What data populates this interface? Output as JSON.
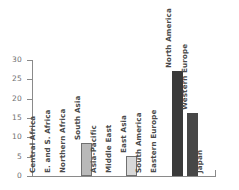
{
  "chart_data": {
    "type": "bar",
    "title": "",
    "xlabel": "",
    "ylabel": "",
    "ylim": [
      0,
      30
    ],
    "yticks": [
      0,
      5,
      10,
      15,
      20,
      25,
      30
    ],
    "grid": false,
    "legend": null,
    "categories": [
      "Central Africa",
      "E. and S. Africa",
      "Northern Africa",
      "South Asia",
      "Asia-Pacific",
      "Middle East",
      "East Asia",
      "South America",
      "Eastern Europe",
      "North America",
      "Western Europe",
      "Japan"
    ],
    "values": [
      0,
      0,
      0,
      8.6,
      0,
      0,
      5.2,
      0,
      0,
      27.2,
      16.4,
      0
    ],
    "bar_colors": [
      "none",
      "none",
      "none",
      "#b9b9b9",
      "none",
      "none",
      "#d8d8d8",
      "none",
      "none",
      "#3a3a3a",
      "#474747",
      "none"
    ],
    "axis_color": "#8a8a8a",
    "label_color": "#4a4a4a",
    "tick_label_color": "#6f6f6f",
    "background": "#ffffff"
  },
  "axis": {
    "tick_labels": [
      "30",
      "25",
      "20",
      "15",
      "10",
      "5",
      "0"
    ]
  }
}
